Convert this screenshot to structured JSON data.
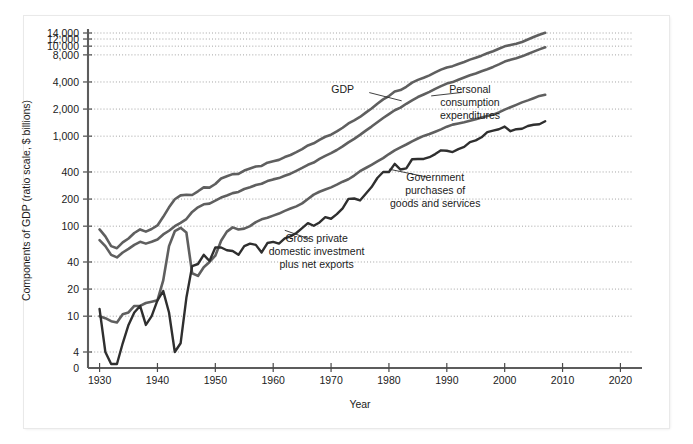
{
  "figure": {
    "faint_top_note": "",
    "background_color": "#ffffff"
  },
  "chart_data": {
    "type": "line",
    "title": "",
    "xlabel": "Year",
    "ylabel": "Components of GDP (ratio scale, $ billions)",
    "scale": "log",
    "grid": true,
    "legend_position": "inline-annotations",
    "xlim": [
      1928,
      2022
    ],
    "ylim": [
      4,
      14000
    ],
    "xticks": [
      1930,
      1940,
      1950,
      1960,
      1970,
      1980,
      1990,
      2000,
      2010,
      2020
    ],
    "xtick_labels": [
      "1930",
      "1940",
      "1950",
      "1960",
      "1970",
      "1980",
      "1990",
      "2000",
      "2010",
      "2020"
    ],
    "yticks": [
      4,
      10,
      20,
      40,
      100,
      200,
      400,
      1000,
      2000,
      4000,
      8000,
      10000,
      12000,
      14000
    ],
    "ytick_labels": [
      "4",
      "10",
      "20",
      "40",
      "100",
      "200",
      "400",
      "1,000",
      "2,000",
      "4,000",
      "8,000",
      "10,000",
      "12,000",
      "14,000"
    ],
    "zero_tick_label": "0",
    "series": [
      {
        "name": "GDP",
        "color": "#5f5f5f",
        "width": 2.6,
        "label": "GDP",
        "label_x": 1972,
        "label_y": 3050,
        "leader": [
          [
            1976.6,
            3050
          ],
          [
            1982.2,
            2470
          ]
        ],
        "x": [
          1930,
          1931,
          1932,
          1933,
          1934,
          1935,
          1936,
          1937,
          1938,
          1939,
          1940,
          1941,
          1942,
          1943,
          1944,
          1945,
          1946,
          1947,
          1948,
          1949,
          1950,
          1951,
          1952,
          1953,
          1954,
          1955,
          1956,
          1957,
          1958,
          1959,
          1960,
          1961,
          1962,
          1963,
          1964,
          1965,
          1966,
          1967,
          1968,
          1969,
          1970,
          1971,
          1972,
          1973,
          1974,
          1975,
          1976,
          1977,
          1978,
          1979,
          1980,
          1981,
          1982,
          1983,
          1984,
          1985,
          1986,
          1987,
          1988,
          1989,
          1990,
          1991,
          1992,
          1993,
          1994,
          1995,
          1996,
          1997,
          1998,
          1999,
          2000,
          2001,
          2002,
          2003,
          2004,
          2005,
          2006,
          2007
        ],
        "y": [
          92,
          77,
          60,
          57,
          66,
          73,
          84,
          92,
          87,
          93,
          102,
          127,
          162,
          199,
          220,
          223,
          222,
          244,
          270,
          268,
          294,
          339,
          358,
          379,
          380,
          415,
          438,
          461,
          467,
          507,
          527,
          545,
          586,
          618,
          664,
          719,
          788,
          833,
          910,
          985,
          1039,
          1128,
          1240,
          1385,
          1501,
          1635,
          1824,
          2031,
          2295,
          2563,
          2790,
          3128,
          3255,
          3537,
          3933,
          4220,
          4463,
          4740,
          5104,
          5484,
          5803,
          5996,
          6338,
          6667,
          7085,
          7415,
          7839,
          8332,
          8794,
          9354,
          9952,
          10286,
          10642,
          11142,
          11868,
          12638,
          13399,
          14062
        ]
      },
      {
        "name": "Personal consumption expenditures",
        "color": "#5f5f5f",
        "width": 2.6,
        "label": "Personal\nconsumption\nexpenditures",
        "label_x": 1994,
        "label_y": 3050,
        "leader": [
          [
            1992.6,
            3060
          ],
          [
            1987.3,
            2800
          ]
        ],
        "x": [
          1930,
          1931,
          1932,
          1933,
          1934,
          1935,
          1936,
          1937,
          1938,
          1939,
          1940,
          1941,
          1942,
          1943,
          1944,
          1945,
          1946,
          1947,
          1948,
          1949,
          1950,
          1951,
          1952,
          1953,
          1954,
          1955,
          1956,
          1957,
          1958,
          1959,
          1960,
          1961,
          1962,
          1963,
          1964,
          1965,
          1966,
          1967,
          1968,
          1969,
          1970,
          1971,
          1972,
          1973,
          1974,
          1975,
          1976,
          1977,
          1978,
          1979,
          1980,
          1981,
          1982,
          1983,
          1984,
          1985,
          1986,
          1987,
          1988,
          1989,
          1990,
          1991,
          1992,
          1993,
          1994,
          1995,
          1996,
          1997,
          1998,
          1999,
          2000,
          2001,
          2002,
          2003,
          2004,
          2005,
          2006,
          2007
        ],
        "y": [
          70,
          60,
          48,
          45,
          51,
          56,
          62,
          67,
          64,
          67,
          71,
          81,
          89,
          100,
          109,
          120,
          144,
          162,
          175,
          178,
          192,
          208,
          219,
          233,
          240,
          259,
          271,
          286,
          296,
          317,
          331,
          342,
          363,
          383,
          412,
          444,
          481,
          509,
          559,
          604,
          648,
          702,
          770,
          852,
          933,
          1034,
          1152,
          1278,
          1428,
          1592,
          1757,
          1941,
          2077,
          2290,
          2503,
          2720,
          2899,
          3100,
          3353,
          3598,
          3840,
          3986,
          4235,
          4478,
          4743,
          4976,
          5257,
          5547,
          5879,
          6282,
          6739,
          7055,
          7351,
          7704,
          8196,
          8694,
          9207,
          9710
        ]
      },
      {
        "name": "Government purchases of goods and services",
        "color": "#5f5f5f",
        "width": 2.6,
        "label": "Government\npurchases of\ngoods and services",
        "label_x": 1988,
        "label_y": 320,
        "leader": [
          [
            1986.5,
            352
          ],
          [
            1980.0,
            430
          ]
        ],
        "x": [
          1930,
          1931,
          1932,
          1933,
          1934,
          1935,
          1936,
          1937,
          1938,
          1939,
          1940,
          1941,
          1942,
          1943,
          1944,
          1945,
          1946,
          1947,
          1948,
          1949,
          1950,
          1951,
          1952,
          1953,
          1954,
          1955,
          1956,
          1957,
          1958,
          1959,
          1960,
          1961,
          1962,
          1963,
          1964,
          1965,
          1966,
          1967,
          1968,
          1969,
          1970,
          1971,
          1972,
          1973,
          1974,
          1975,
          1976,
          1977,
          1978,
          1979,
          1980,
          1981,
          1982,
          1983,
          1984,
          1985,
          1986,
          1987,
          1988,
          1989,
          1990,
          1991,
          1992,
          1993,
          1994,
          1995,
          1996,
          1997,
          1998,
          1999,
          2000,
          2001,
          2002,
          2003,
          2004,
          2005,
          2006,
          2007
        ],
        "y": [
          10,
          9.5,
          8.8,
          8.5,
          10.5,
          11,
          13,
          13,
          14,
          14.5,
          15,
          25,
          60,
          88,
          96,
          85,
          30,
          28,
          35,
          40,
          47,
          69,
          87,
          97,
          92,
          94,
          100,
          111,
          119,
          124,
          131,
          138,
          148,
          157,
          166,
          179,
          200,
          224,
          241,
          255,
          270,
          289,
          312,
          332,
          365,
          408,
          443,
          481,
          524,
          571,
          633,
          695,
          752,
          808,
          876,
          942,
          1006,
          1056,
          1119,
          1190,
          1275,
          1344,
          1385,
          1430,
          1482,
          1541,
          1610,
          1675,
          1736,
          1835,
          1973,
          2096,
          2229,
          2374,
          2497,
          2642,
          2801,
          2885
        ]
      },
      {
        "name": "Gross private domestic investment plus net exports",
        "color": "#2f2f2f",
        "width": 2.4,
        "label": "Gross private\ndomestic investment\nplus net exports",
        "label_x": 1967.5,
        "label_y": 66,
        "leader": [
          [
            1966.3,
            72
          ],
          [
            1962.0,
            90
          ]
        ],
        "x": [
          1930,
          1931,
          1932,
          1933,
          1934,
          1935,
          1936,
          1937,
          1938,
          1939,
          1940,
          1941,
          1942,
          1943,
          1944,
          1945,
          1946,
          1947,
          1948,
          1949,
          1950,
          1951,
          1952,
          1953,
          1954,
          1955,
          1956,
          1957,
          1958,
          1959,
          1960,
          1961,
          1962,
          1963,
          1964,
          1965,
          1966,
          1967,
          1968,
          1969,
          1970,
          1971,
          1972,
          1973,
          1974,
          1975,
          1976,
          1977,
          1978,
          1979,
          1980,
          1981,
          1982,
          1983,
          1984,
          1985,
          1986,
          1987,
          1988,
          1989,
          1990,
          1991,
          1992,
          1993,
          1994,
          1995,
          1996,
          1997,
          1998,
          1999,
          2000,
          2001,
          2002,
          2003,
          2004,
          2005,
          2006,
          2007
        ],
        "y": [
          12,
          4,
          1,
          1,
          5,
          8,
          11,
          13,
          8,
          10,
          15,
          19,
          11,
          4,
          5,
          16,
          36,
          38,
          48,
          41,
          58,
          58,
          54,
          53,
          48,
          60,
          64,
          62,
          51,
          65,
          67,
          64,
          73,
          77,
          84,
          95,
          108,
          101,
          110,
          126,
          121,
          136,
          158,
          201,
          203,
          193,
          229,
          272,
          343,
          400,
          400,
          492,
          426,
          439,
          554,
          558,
          558,
          584,
          632,
          696,
          688,
          666,
          718,
          759,
          860,
          898,
          972,
          1110,
          1150,
          1194,
          1278,
          1135,
          1195,
          1209,
          1298,
          1340,
          1356,
          1465
        ]
      }
    ]
  }
}
